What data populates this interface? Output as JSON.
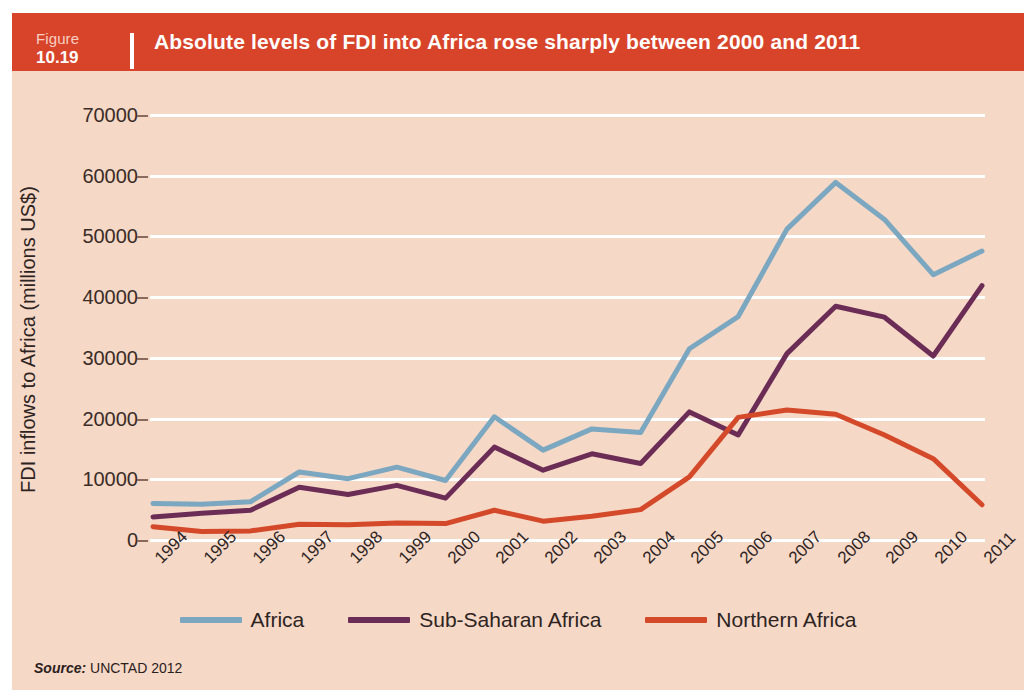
{
  "header": {
    "figure_word": "Figure",
    "figure_number": "10.19",
    "title": "Absolute levels of FDI into Africa rose sharply between 2000 and 2011"
  },
  "source": {
    "label": "Source:",
    "value": "UNCTAD 2012"
  },
  "colors": {
    "title_bar": "#d8442a",
    "panel_background": "#f6d8c6",
    "gridline": "#ffffff",
    "africa": "#7ba7c0",
    "sub_saharan_africa": "#6b2d55",
    "northern_africa": "#d4492a",
    "text": "#2e241f"
  },
  "chart_data": {
    "type": "line",
    "title": "Absolute levels of FDI into Africa rose sharply between 2000 and 2011",
    "xlabel": "",
    "ylabel": "FDI inflows to Africa (millions US$)",
    "ylim": [
      0,
      70000
    ],
    "ytick_labels": [
      "70000",
      "60000",
      "50000",
      "40000",
      "30000",
      "20000",
      "10000",
      "0"
    ],
    "yticks": [
      70000,
      60000,
      50000,
      40000,
      30000,
      20000,
      10000,
      0
    ],
    "grid": true,
    "legend_position": "bottom",
    "categories": [
      "1994",
      "1995",
      "1996",
      "1997",
      "1998",
      "1999",
      "2000",
      "2001",
      "2002",
      "2003",
      "2004",
      "2005",
      "2006",
      "2007",
      "2008",
      "2009",
      "2010",
      "2011"
    ],
    "series": [
      {
        "name": "Africa",
        "color": "#7ba7c0",
        "values": [
          6000,
          5900,
          6300,
          11200,
          10100,
          12000,
          9800,
          20300,
          14800,
          18300,
          17700,
          31500,
          36800,
          51200,
          58900,
          52800,
          43700,
          47600
        ]
      },
      {
        "name": "Sub-Saharan Africa",
        "color": "#6b2d55",
        "values": [
          3800,
          4400,
          4900,
          8700,
          7500,
          9000,
          6900,
          15300,
          11500,
          14200,
          12600,
          21100,
          17300,
          30700,
          38500,
          36700,
          30300,
          41900
        ]
      },
      {
        "name": "Northern Africa",
        "color": "#d4492a",
        "values": [
          2200,
          1400,
          1500,
          2600,
          2500,
          2800,
          2700,
          4900,
          3100,
          3900,
          5000,
          10400,
          20200,
          21400,
          20700,
          17300,
          13400,
          5800
        ]
      }
    ]
  }
}
